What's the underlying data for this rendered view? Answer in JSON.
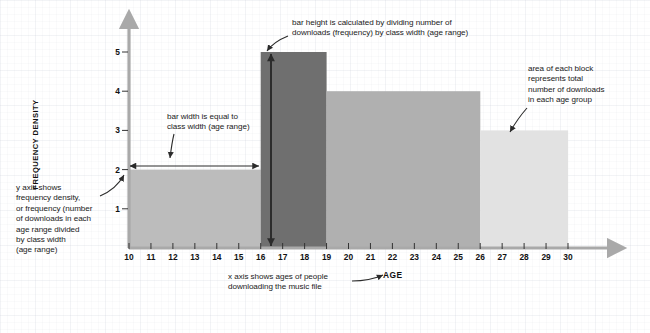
{
  "chart_data": {
    "type": "bar",
    "title": "",
    "subtitle": "",
    "xlabel": "AGE",
    "ylabel": "FREQUENCY DENSITY",
    "xlim": [
      10,
      30
    ],
    "ylim": [
      0,
      5.6
    ],
    "grid": true,
    "legend": "none",
    "xticks": [
      10,
      11,
      12,
      13,
      14,
      15,
      16,
      17,
      18,
      19,
      20,
      21,
      22,
      23,
      24,
      25,
      26,
      27,
      28,
      29,
      30
    ],
    "yticks": [
      1,
      2,
      3,
      4,
      5
    ],
    "bars": [
      {
        "label": "10-16",
        "x_start": 10,
        "x_end": 16,
        "frequency_density": 2,
        "class_width": 6,
        "total_downloads": 12,
        "color": "#bcbcbc"
      },
      {
        "label": "16-19",
        "x_start": 16,
        "x_end": 19,
        "frequency_density": 5,
        "class_width": 3,
        "total_downloads": 15,
        "color": "#6f6f6f"
      },
      {
        "label": "19-26",
        "x_start": 19,
        "x_end": 26,
        "frequency_density": 4,
        "class_width": 7,
        "total_downloads": 28,
        "color": "#b0b0b0"
      },
      {
        "label": "26-30",
        "x_start": 26,
        "x_end": 30,
        "frequency_density": 3,
        "class_width": 4,
        "total_downloads": 12,
        "color": "#e2e2e2"
      }
    ],
    "annotations": [
      {
        "name": "bar-height",
        "text": "bar height is calculated by dividing number of\ndownloads (frequency) by class width (age range)"
      },
      {
        "name": "area-of-block",
        "text": "area of each block\nrepresents total\nnumber of downloads\nin each age group"
      },
      {
        "name": "bar-width",
        "text": "bar width is equal to\nclass width (age range)"
      },
      {
        "name": "y-axis",
        "text": "y axis shows\nfrequency density,\nor frequency (number\nof downloads in each\nage range divided\nby class width\n(age range)"
      },
      {
        "name": "x-axis",
        "text": "x axis shows ages of people\ndownloading the music file"
      }
    ]
  },
  "colors": {
    "axis": "#a9a9a9",
    "annotation_line": "#2b2b2b",
    "text": "#1a1a1a",
    "background": "#ffffff"
  }
}
